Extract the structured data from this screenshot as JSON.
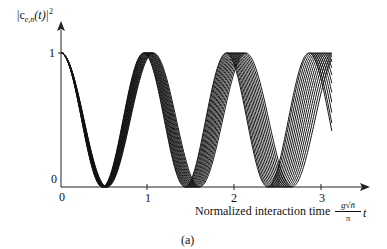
{
  "chart_data": {
    "type": "line",
    "title": "",
    "caption": "(a)",
    "ylabel": "|c_{e,n}(t)|^2",
    "xlabel": "Normalized interaction time",
    "xlabel_factor": {
      "numerator": "g√n̄",
      "denominator": "π",
      "variable": "t"
    },
    "x_ticks": [
      "0",
      "1",
      "2",
      "3"
    ],
    "y_ticks": [
      "0",
      "1"
    ],
    "xlim": [
      0,
      3.5
    ],
    "ylim": [
      0,
      1
    ],
    "grid": false,
    "legend": null,
    "function": "cos^2(pi * f * t), family of curves with frequency factor f",
    "frequency_factors": [
      0.94,
      0.948,
      0.956,
      0.964,
      0.972,
      0.98,
      0.988,
      0.996,
      1.004,
      1.012,
      1.02,
      1.028,
      1.036,
      1.044,
      1.05
    ],
    "t_range": [
      0,
      3.12
    ],
    "annotations": {
      "minima_at_t": [
        0.5,
        1.5,
        2.5
      ],
      "maxima_at_t": [
        0,
        1,
        2,
        3
      ],
      "note": "Curves dephase progressively with time; spread at t≈2.5 spans ~2.38–2.66"
    }
  },
  "labels": {
    "ylabel_main": "|c",
    "ylabel_sub": "e,n",
    "ylabel_paren": "(t)|",
    "ylabel_sup": "2",
    "y_tick_1": "1",
    "y_tick_0": "0",
    "x_tick_0": "0",
    "x_tick_1": "1",
    "x_tick_2": "2",
    "x_tick_3": "3",
    "xlabel": "Normalized interaction time",
    "frac_num": "g√n̄",
    "frac_den": "π",
    "tvar": "t",
    "caption": "(a)"
  },
  "colors": {
    "line": "#111111",
    "axis": "#222222",
    "background": "#ffffff"
  }
}
